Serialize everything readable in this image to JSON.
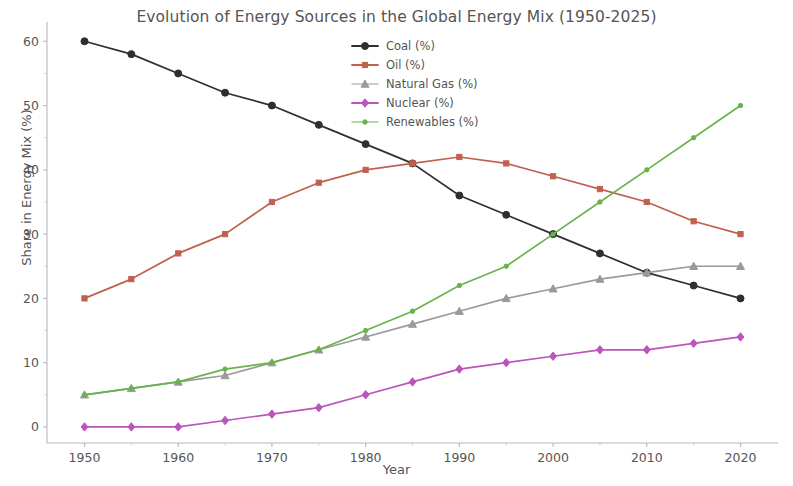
{
  "chart_data": {
    "type": "line",
    "title": "Evolution of Energy Sources in the Global Energy Mix (1950-2025)",
    "xlabel": "Year",
    "ylabel": "Share in Energy Mix (%)",
    "x": [
      1950,
      1955,
      1960,
      1965,
      1970,
      1975,
      1980,
      1985,
      1990,
      1995,
      2000,
      2005,
      2010,
      2015,
      2020
    ],
    "xlim": [
      1946,
      2024
    ],
    "ylim": [
      -2.5,
      63
    ],
    "xticks": [
      1950,
      1960,
      1970,
      1980,
      1990,
      2000,
      2010,
      2020
    ],
    "xticklabels": [
      "1950",
      "1960",
      "1970",
      "1980",
      "1990",
      "2000",
      "2010",
      "2020"
    ],
    "xticks_minor": [
      1955,
      1965,
      1975,
      1985,
      1995,
      2005,
      2015
    ],
    "yticks": [
      0,
      10,
      20,
      30,
      40,
      50,
      60
    ],
    "yticklabels": [
      "0",
      "10",
      "20",
      "30",
      "40",
      "50",
      "60"
    ],
    "grid": false,
    "legend_position": "upper center",
    "series": [
      {
        "name": "Coal (%)",
        "color": "#2f2f2f",
        "marker": "circle",
        "values": [
          60,
          58,
          55,
          52,
          50,
          47,
          44,
          41,
          36,
          33,
          30,
          27,
          24,
          22,
          20
        ]
      },
      {
        "name": "Oil (%)",
        "color": "#c1604f",
        "marker": "square",
        "values": [
          20,
          23,
          27,
          30,
          35,
          38,
          40,
          41,
          42,
          41,
          39,
          37,
          35,
          32,
          30
        ]
      },
      {
        "name": "Natural Gas (%)",
        "color": "#9a9a9a",
        "marker": "triangle",
        "values": [
          5,
          6,
          7,
          8,
          10,
          12,
          14,
          16,
          18,
          20,
          21.5,
          23,
          24,
          25,
          25
        ]
      },
      {
        "name": "Nuclear (%)",
        "color": "#bb55bb",
        "marker": "diamond",
        "values": [
          0,
          0,
          0,
          1,
          2,
          3,
          5,
          7,
          9,
          10,
          11,
          12,
          12,
          13,
          14
        ]
      },
      {
        "name": "Renewables (%)",
        "color": "#69b34c",
        "marker": "circle-small",
        "values": [
          5,
          6,
          7,
          9,
          10,
          12,
          15,
          18,
          22,
          25,
          30,
          35,
          40,
          45,
          50
        ]
      }
    ]
  }
}
